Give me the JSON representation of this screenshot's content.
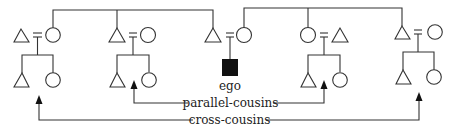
{
  "diagram": {
    "type": "kinship-chart",
    "colors": {
      "line": "#333333",
      "ego_fill": "#111111",
      "background": "#ffffff"
    },
    "labels": {
      "ego": "ego",
      "parallel_cousins": "parallel-cousins",
      "cross_cousins": "cross-cousins"
    },
    "legend_symbols": {
      "triangle": "male",
      "circle": "female",
      "equals": "marriage",
      "filled_square": "ego"
    },
    "families": [
      {
        "name": "father's sister's family",
        "parents": [
          "triangle",
          "circle"
        ],
        "children": [
          "triangle",
          "circle"
        ],
        "cousin_type": "cross-cousins"
      },
      {
        "name": "father's brother's family",
        "parents": [
          "triangle",
          "circle"
        ],
        "children": [
          "triangle",
          "circle"
        ],
        "cousin_type": "parallel-cousins"
      },
      {
        "name": "ego's parents",
        "parents": [
          "triangle",
          "circle"
        ],
        "children": [
          "ego"
        ]
      },
      {
        "name": "mother's sister's family",
        "parents": [
          "circle",
          "triangle"
        ],
        "children": [
          "triangle",
          "circle"
        ],
        "cousin_type": "parallel-cousins"
      },
      {
        "name": "mother's brother's family",
        "parents": [
          "triangle",
          "circle"
        ],
        "children": [
          "triangle",
          "circle"
        ],
        "cousin_type": "cross-cousins"
      }
    ]
  }
}
